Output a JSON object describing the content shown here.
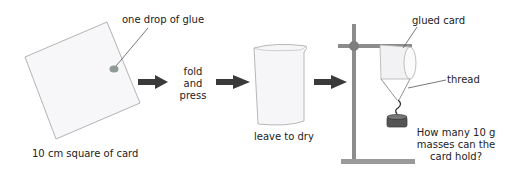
{
  "diagram": {
    "steps": [
      {
        "id": "card",
        "label": "10 cm square of card",
        "annotation": "one drop of glue"
      },
      {
        "id": "fold",
        "label_lines": [
          "fold",
          "and",
          "press"
        ]
      },
      {
        "id": "dry",
        "label": "leave to dry"
      },
      {
        "id": "test",
        "annotation_card": "glued card",
        "annotation_thread": "thread",
        "question_lines": [
          "How many 10 g",
          "masses can the",
          "card hold?"
        ]
      }
    ],
    "colors": {
      "arrow": "#3a3a3a",
      "card_fill": "#f7f7f9",
      "card_stroke": "#b0b0b0",
      "glue": "#8f9a95",
      "stand": "#8c8c8c",
      "mass": "#4a4a4a"
    }
  }
}
